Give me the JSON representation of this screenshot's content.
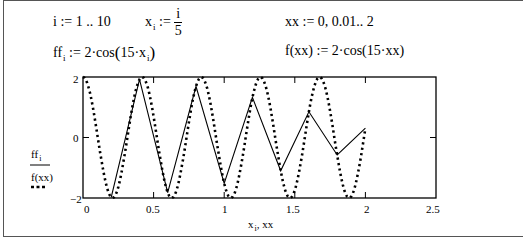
{
  "worksheet": {
    "eq_range_i": {
      "var": "i",
      "assign": ":=",
      "value": "1 .. 10"
    },
    "eq_x": {
      "var": "x",
      "sub": "i",
      "assign": ":=",
      "num": "i",
      "den": "5"
    },
    "eq_ff": {
      "var": "ff",
      "sub": "i",
      "assign": ":=",
      "prefix": "2·cos",
      "arg_pre": "15·x",
      "arg_sub": "i"
    },
    "eq_xx": {
      "text": "xx := 0, 0.01.. 2"
    },
    "eq_f": {
      "text": "f(xx) := 2·cos(15·xx)"
    }
  },
  "plot": {
    "y_axis_ticks": {
      "top": "2",
      "mid": "0",
      "bottom": "−2"
    },
    "x_axis_ticks": [
      "0",
      "0.5",
      "1",
      "1.5",
      "2",
      "2.5"
    ],
    "legend": {
      "series1": "ff",
      "series1_sub": "i",
      "series2": "f(xx)"
    },
    "xlabel_var": "x",
    "xlabel_sub": "i",
    "xlabel_rest": ", xx"
  },
  "chart_data": {
    "type": "line",
    "title": "",
    "xlabel": "x_i, xx",
    "ylabel": "ff_i, f(xx)",
    "xlim": [
      0,
      2.5
    ],
    "ylim": [
      -2,
      2
    ],
    "grid": false,
    "legend_position": "left",
    "series": [
      {
        "name": "ff_i",
        "style": "solid",
        "x": [
          0.2,
          0.4,
          0.6,
          0.8,
          1.0,
          1.2,
          1.4,
          1.6,
          1.8,
          2.0
        ],
        "values": [
          -1.98,
          1.92,
          -1.82,
          1.69,
          -1.52,
          1.33,
          -1.1,
          0.85,
          -0.58,
          0.31
        ]
      },
      {
        "name": "f(xx)",
        "style": "dotted",
        "x_range": [
          0,
          2
        ],
        "x_step": 0.01,
        "formula": "2*cos(15*xx)"
      }
    ]
  }
}
